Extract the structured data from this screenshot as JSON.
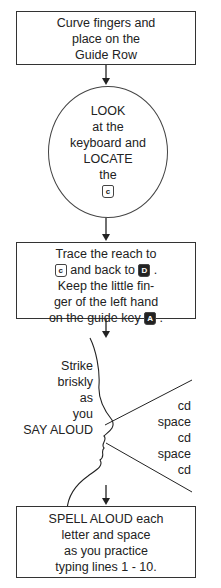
{
  "steps": {
    "step1": {
      "lines": [
        "Curve fingers and",
        "place on the",
        "Guide Row"
      ]
    },
    "step2": {
      "lines": [
        "LOOK",
        "at the",
        "keyboard and",
        "LOCATE",
        "the"
      ],
      "key": "c"
    },
    "step3": {
      "line1": "Trace the reach to",
      "key_c": "c",
      "line2_mid": " and back to ",
      "key_d": "D",
      "line2_end": " .",
      "line3": "Keep the little fin-",
      "line4": "ger of the left hand",
      "line5": "on the guide key ",
      "key_a": "A",
      "line5_end": " ."
    },
    "step4": {
      "left_lines": [
        "Strike",
        "briskly",
        "as",
        "you",
        "SAY ALOUD"
      ],
      "right_lines": [
        "cd",
        "space",
        "cd",
        "space",
        "cd"
      ]
    },
    "step5": {
      "lines": [
        "SPELL ALOUD each",
        "letter and space",
        "as you practice",
        "typing lines 1 - 10."
      ]
    }
  }
}
